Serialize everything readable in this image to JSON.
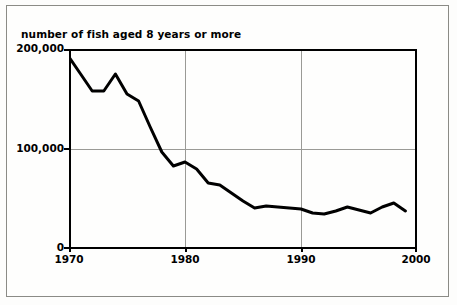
{
  "figure": {
    "title": "number of fish aged 8 years or more",
    "line_color": "#000000",
    "grid_color": "#9a9a96",
    "axis_color": "#000000",
    "background_color": "#fefefd"
  },
  "axes": {
    "y_ticks": [
      "0",
      "100,000",
      "200,000"
    ],
    "x_ticks": [
      "1970",
      "1980",
      "1990",
      "2000"
    ]
  },
  "chart_data": {
    "type": "line",
    "title": "number of fish aged 8 years or more",
    "xlabel": "",
    "ylabel": "number of fish aged 8 years or more",
    "xlim": [
      1970,
      2000
    ],
    "ylim": [
      0,
      200000
    ],
    "xticks": [
      1970,
      1980,
      1990,
      2000
    ],
    "yticks": [
      0,
      100000,
      200000
    ],
    "grid": true,
    "legend": "none",
    "x": [
      1970,
      1971,
      1972,
      1973,
      1974,
      1975,
      1976,
      1977,
      1978,
      1979,
      1980,
      1981,
      1982,
      1983,
      1984,
      1985,
      1986,
      1987,
      1988,
      1989,
      1990,
      1991,
      1992,
      1993,
      1994,
      1995,
      1996,
      1997,
      1998,
      1999
    ],
    "values": [
      192000,
      175000,
      158000,
      158000,
      175000,
      155000,
      148000,
      122000,
      97000,
      83000,
      87000,
      80000,
      66000,
      64000,
      56000,
      48000,
      41000,
      43000,
      42000,
      41000,
      40000,
      36000,
      35000,
      38000,
      42000,
      39000,
      36000,
      42000,
      46000,
      38000
    ],
    "series": [
      {
        "name": "number of fish aged 8 years or more",
        "values": [
          192000,
          175000,
          158000,
          158000,
          175000,
          155000,
          148000,
          122000,
          97000,
          83000,
          87000,
          80000,
          66000,
          64000,
          56000,
          48000,
          41000,
          43000,
          42000,
          41000,
          40000,
          36000,
          35000,
          38000,
          42000,
          39000,
          36000,
          42000,
          46000,
          38000
        ]
      }
    ]
  }
}
